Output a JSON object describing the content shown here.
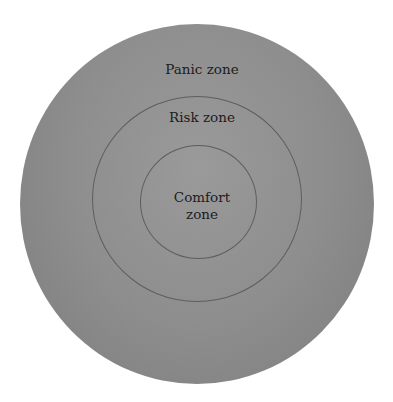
{
  "diagram": {
    "type": "concentric-circles",
    "fill_color": "#8f8f8f",
    "stroke_color": "#5e5e5e",
    "zones": [
      {
        "id": "outer",
        "label": "Panic zone"
      },
      {
        "id": "middle",
        "label": "Risk zone"
      },
      {
        "id": "inner",
        "label_line1": "Comfort",
        "label_line2": "zone"
      }
    ]
  }
}
